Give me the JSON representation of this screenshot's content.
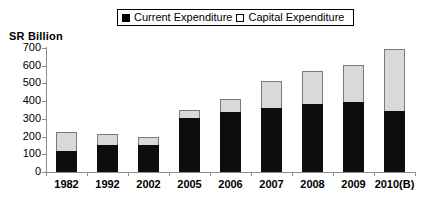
{
  "axis_title": "SR Billion",
  "legend": {
    "entries": [
      {
        "label": "Current Expenditure",
        "swatch": "filled-black-square",
        "color": "#000000"
      },
      {
        "label": "Capital Expenditure",
        "swatch": "open-white-square",
        "color": "#ffffff"
      }
    ]
  },
  "chart_data": {
    "type": "bar",
    "stacked": true,
    "title": "",
    "subtitle": "",
    "xlabel": "",
    "ylabel": "SR Billion",
    "ylim": [
      0,
      700
    ],
    "yticks": [
      0,
      100,
      200,
      300,
      400,
      500,
      600,
      700
    ],
    "ytick_labels": [
      "0",
      "100",
      "200",
      "300",
      "400",
      "500",
      "600",
      "700"
    ],
    "grid": false,
    "legend_position": "top-center",
    "categories": [
      "1982",
      "1992",
      "2002",
      "2005",
      "2006",
      "2007",
      "2008",
      "2009",
      "2010(B)"
    ],
    "series": [
      {
        "name": "Current Expenditure",
        "color": "#000000",
        "values": [
          120,
          155,
          155,
          305,
          340,
          362,
          382,
          395,
          345
        ]
      },
      {
        "name": "Capital Expenditure",
        "color": "#d9d9d9",
        "values": [
          105,
          60,
          45,
          45,
          70,
          152,
          190,
          210,
          350
        ]
      }
    ],
    "totals": [
      225,
      215,
      200,
      350,
      410,
      514,
      572,
      605,
      695
    ]
  }
}
